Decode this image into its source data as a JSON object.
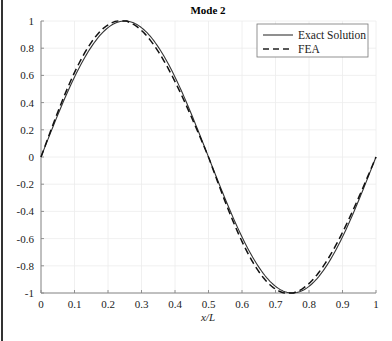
{
  "chart_data": {
    "type": "line",
    "title": "Mode 2",
    "xlabel": "x/L",
    "ylabel": "",
    "xlim": [
      0,
      1
    ],
    "ylim": [
      -1,
      1
    ],
    "grid": true,
    "legend_position": "upper right",
    "xticks": [
      "0",
      "0.1",
      "0.2",
      "0.3",
      "0.4",
      "0.5",
      "0.6",
      "0.7",
      "0.8",
      "0.9",
      "1"
    ],
    "yticks": [
      "1",
      "0.8",
      "0.6",
      "0.4",
      "0.2",
      "0",
      "-0.2",
      "-0.4",
      "-0.6",
      "-0.8",
      "-1"
    ],
    "x": [
      0,
      0.05,
      0.1,
      0.15,
      0.2,
      0.25,
      0.3,
      0.35,
      0.4,
      0.45,
      0.5,
      0.55,
      0.6,
      0.65,
      0.7,
      0.75,
      0.8,
      0.85,
      0.9,
      0.95,
      1.0
    ],
    "series": [
      {
        "name": "Exact Solution",
        "style": "solid",
        "values": [
          0,
          0.309,
          0.588,
          0.809,
          0.951,
          1.0,
          0.951,
          0.809,
          0.588,
          0.309,
          0,
          -0.309,
          -0.588,
          -0.809,
          -0.951,
          -1.0,
          -0.951,
          -0.809,
          -0.588,
          -0.309,
          0
        ]
      },
      {
        "name": "FEA",
        "style": "dashed",
        "values": [
          0,
          0.34,
          0.63,
          0.84,
          0.965,
          1.0,
          0.965,
          0.84,
          0.63,
          0.34,
          0,
          -0.34,
          -0.63,
          -0.84,
          -0.965,
          -1.0,
          -0.965,
          -0.84,
          -0.63,
          -0.34,
          0
        ]
      }
    ]
  },
  "legend": {
    "items": [
      "Exact Solution",
      "FEA"
    ]
  }
}
